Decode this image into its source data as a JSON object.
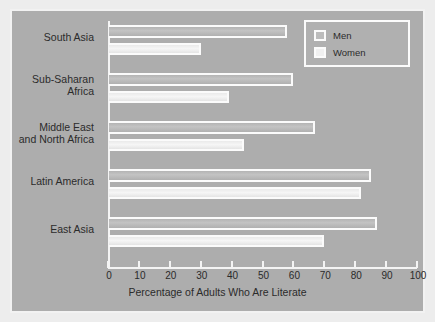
{
  "chart_data": {
    "type": "bar",
    "orientation": "horizontal",
    "title": "",
    "xlabel": "Percentage of Adults Who Are Literate",
    "ylabel": "",
    "xlim": [
      0,
      100
    ],
    "xticks": [
      0,
      10,
      20,
      30,
      40,
      50,
      60,
      70,
      80,
      90,
      100
    ],
    "grid": false,
    "legend_position": "top-right",
    "categories": [
      "South Asia",
      "Sub-Saharan Africa",
      "Middle East and North Africa",
      "Latin America",
      "East Asia"
    ],
    "category_labels_display": [
      [
        "South Asia"
      ],
      [
        "Sub-Saharan",
        "Africa"
      ],
      [
        "Middle East",
        "and North Africa"
      ],
      [
        "Latin America"
      ],
      [
        "East Asia"
      ]
    ],
    "series": [
      {
        "name": "Men",
        "values": [
          58,
          60,
          67,
          85,
          87
        ]
      },
      {
        "name": "Women",
        "values": [
          30,
          39,
          44,
          82,
          70
        ]
      }
    ]
  },
  "legend": {
    "items": [
      {
        "label": "Men",
        "swatch": "men-swatch"
      },
      {
        "label": "Women",
        "swatch": "women-swatch"
      }
    ]
  },
  "colors": {
    "panel_background": "#adadad",
    "page_background": "#ededed",
    "axis": "#f4f4f4",
    "men_bar": "#bcbcbc",
    "women_bar": "#f0f0f0",
    "text": "#2b2b2b"
  }
}
